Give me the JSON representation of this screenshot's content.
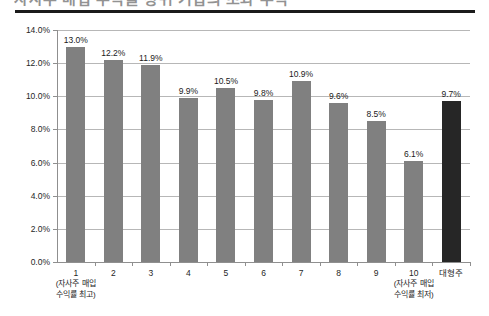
{
  "title_clipped": "자사주 매입 수익률 상위 기업의 초과 수익",
  "chart_data": {
    "type": "bar",
    "title": "",
    "xlabel": "",
    "ylabel": "",
    "ylim": [
      0,
      14
    ],
    "ytick_values": [
      0,
      2,
      4,
      6,
      8,
      10,
      12,
      14
    ],
    "ytick_labels": [
      "0.0%",
      "2.0%",
      "4.0%",
      "6.0%",
      "8.0%",
      "10.0%",
      "12.0%",
      "14.0%"
    ],
    "grid": "horizontal",
    "legend": "none",
    "categories": [
      "1",
      "2",
      "3",
      "4",
      "5",
      "6",
      "7",
      "8",
      "9",
      "10",
      "대형주"
    ],
    "category_sublabels": [
      "(자사주 매입\n수익률 최고)",
      "",
      "",
      "",
      "",
      "",
      "",
      "",
      "",
      "(자사주 매입\n수익률 최저)",
      ""
    ],
    "values": [
      13.0,
      12.2,
      11.9,
      9.9,
      10.5,
      9.8,
      10.9,
      9.6,
      8.5,
      6.1,
      9.7
    ],
    "value_labels": [
      "13.0%",
      "12.2%",
      "11.9%",
      "9.9%",
      "10.5%",
      "9.8%",
      "10.9%",
      "9.6%",
      "8.5%",
      "6.1%",
      "9.7%"
    ],
    "bar_colors": [
      "#808080",
      "#808080",
      "#808080",
      "#808080",
      "#808080",
      "#808080",
      "#808080",
      "#808080",
      "#808080",
      "#808080",
      "#262626"
    ],
    "accent_color": "#808080",
    "highlight_color": "#262626",
    "grid_color": "#b7b7b7",
    "axis_color": "#8f8f8f"
  }
}
